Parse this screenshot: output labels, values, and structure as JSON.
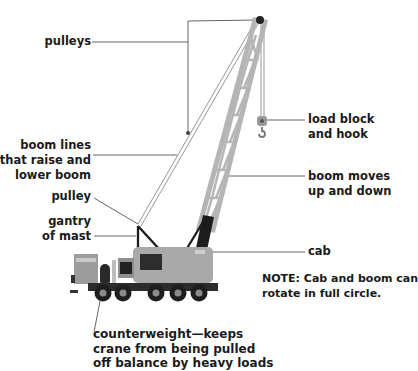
{
  "diagram": {
    "labels": {
      "pulleys": "pulleys",
      "boom_lines": [
        "boom lines",
        "that raise and",
        "lower boom"
      ],
      "pulley": "pulley",
      "gantry": [
        "gantry",
        "of mast"
      ],
      "load_block": [
        "load block",
        "and hook"
      ],
      "boom_moves": [
        "boom moves",
        "up and down"
      ],
      "cab": "cab",
      "note": [
        "NOTE: Cab and boom can",
        "rotate in full circle."
      ],
      "counterweight": [
        "counterweight—keeps",
        "crane from being pulled",
        "off balance by heavy loads"
      ]
    },
    "colors": {
      "background": "#ffffff",
      "text": "#1a1a1a",
      "leader_line": "#555555",
      "boom": "#b5b5b5",
      "boom_base": "#1c1c1c",
      "cab_body": "#a9a9a9",
      "truck": "#8f8f8f",
      "tires": "#1e1e1e"
    }
  }
}
